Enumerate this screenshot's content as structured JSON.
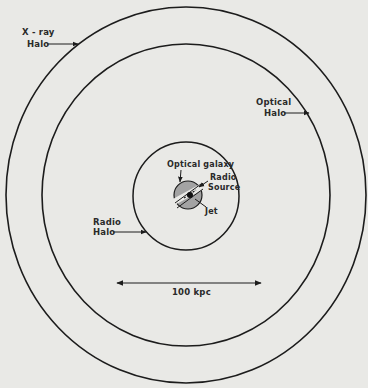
{
  "diagram": {
    "title": "",
    "colors": {
      "background": "#e9e9e6",
      "line": "#1c1c1c",
      "galaxy_fill": "#a3a3a3",
      "text": "#2a2a2a"
    },
    "regions": [
      {
        "id": "xray-halo",
        "label_line1": "X - ray",
        "label_line2": "Halo",
        "shape": "circle",
        "cx": 186,
        "cy": 195,
        "rx": 180,
        "ry": 188
      },
      {
        "id": "optical-halo",
        "label_line1": "Optical",
        "label_line2": "Halo",
        "shape": "circle",
        "cx": 186,
        "cy": 195,
        "rx": 144,
        "ry": 151
      },
      {
        "id": "radio-halo",
        "label_line1": "Radio",
        "label_line2": "Halo",
        "shape": "circle",
        "cx": 186,
        "cy": 196,
        "rx": 53,
        "ry": 54
      }
    ],
    "center": {
      "optical_galaxy_label": "Optical galaxy",
      "radio_source_label_line1": "Radio",
      "radio_source_label_line2": "Source",
      "jet_label": "Jet"
    },
    "scale_bar": {
      "label": "100 kpc",
      "x1": 116,
      "x2": 262,
      "y": 283
    }
  }
}
